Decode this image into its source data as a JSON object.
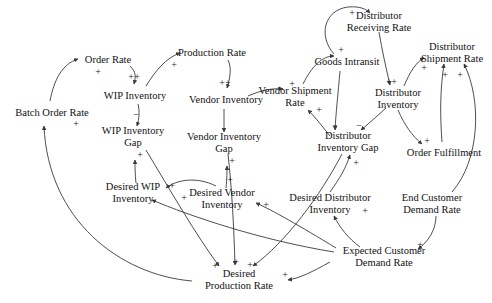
{
  "diagram": {
    "width": 492,
    "height": 303,
    "background_color": "#ffffff",
    "stroke_color": "#3a3a3a",
    "text_color": "#111111"
  },
  "nodes": [
    {
      "id": "batch_order_rate",
      "label": "Batch Order Rate",
      "lines": [
        "Batch Order Rate"
      ],
      "x": 52,
      "y": 113
    },
    {
      "id": "order_rate",
      "label": "Order Rate",
      "lines": [
        "Order Rate"
      ],
      "x": 108,
      "y": 60
    },
    {
      "id": "wip_inventory",
      "label": "WIP Inventory",
      "lines": [
        "WIP Inventory"
      ],
      "x": 135,
      "y": 96
    },
    {
      "id": "wip_inventory_gap",
      "label": "WIP Inventory Gap",
      "lines": [
        "WIP Inventory",
        "Gap"
      ],
      "x": 133,
      "y": 136
    },
    {
      "id": "production_rate",
      "label": "Production Rate",
      "lines": [
        "Production Rate"
      ],
      "x": 212,
      "y": 53
    },
    {
      "id": "vendor_inventory",
      "label": "Vendor Inventory",
      "lines": [
        "Vendor Inventory"
      ],
      "x": 226,
      "y": 100
    },
    {
      "id": "vendor_inventory_gap",
      "label": "Vendor Inventory Gap",
      "lines": [
        "Vendor Inventory",
        "Gap"
      ],
      "x": 224,
      "y": 142
    },
    {
      "id": "vendor_shipment_rate",
      "label": "Vendor Shipment Rate",
      "lines": [
        "Vendor Shipment",
        "Rate"
      ],
      "x": 295,
      "y": 96
    },
    {
      "id": "goods_intransit",
      "label": "Goods Intransit",
      "lines": [
        "Goods Intransit"
      ],
      "x": 347,
      "y": 62
    },
    {
      "id": "distributor_receiving_rate",
      "label": "Distributor Receiving Rate",
      "lines": [
        "Distributor",
        "Receiving Rate"
      ],
      "x": 379,
      "y": 21
    },
    {
      "id": "distributor_inventory",
      "label": "Distributor Inventory",
      "lines": [
        "Distributor",
        "Inventory"
      ],
      "x": 398,
      "y": 98
    },
    {
      "id": "distributor_shipment_rate",
      "label": "Distributor Shipment Rate",
      "lines": [
        "Distributor",
        "Shipment Rate"
      ],
      "x": 452,
      "y": 52
    },
    {
      "id": "distributor_inventory_gap",
      "label": "Distributor Inventory Gap",
      "lines": [
        "Distributor",
        "Inventory Gap"
      ],
      "x": 348,
      "y": 141
    },
    {
      "id": "order_fulfillment",
      "label": "Order Fulfillment",
      "lines": [
        "Order Fulfillment"
      ],
      "x": 444,
      "y": 153
    },
    {
      "id": "desired_wip_inventory",
      "label": "Desired WIP Inventory",
      "lines": [
        "Desired WIP",
        "Inventory"
      ],
      "x": 133,
      "y": 192
    },
    {
      "id": "desired_vendor_inventory",
      "label": "Desired Vendor Inventory",
      "lines": [
        "Desired Vendor",
        "Inventory"
      ],
      "x": 222,
      "y": 198
    },
    {
      "id": "desired_distributor_inventory",
      "label": "Desired Distributor Inventory",
      "lines": [
        "Desired Distributor",
        "Inventory"
      ],
      "x": 330,
      "y": 203
    },
    {
      "id": "end_customer_demand_rate",
      "label": "End Customer Demand Rate",
      "lines": [
        "End Customer",
        "Demand Rate"
      ],
      "x": 432,
      "y": 203
    },
    {
      "id": "expected_customer_demand_rate",
      "label": "Expected Customer Demand Rate",
      "lines": [
        "Expected Customer",
        "Demand Rate"
      ],
      "x": 384,
      "y": 256
    },
    {
      "id": "desired_production_rate",
      "label": "Desired Production Rate",
      "lines": [
        "Desired",
        "Production Rate"
      ],
      "x": 239,
      "y": 279
    }
  ],
  "signs": [
    {
      "id": "s1",
      "symbol": "+",
      "x": 76,
      "y": 124,
      "for": "batch-order-rate-inflow"
    },
    {
      "id": "s2",
      "symbol": "+",
      "x": 98,
      "y": 72,
      "for": "order-rate-inflow"
    },
    {
      "id": "s3",
      "symbol": "+",
      "x": 131,
      "y": 77,
      "for": "wip-inventory-inflow-a"
    },
    {
      "id": "s4",
      "symbol": "+",
      "x": 137,
      "y": 77,
      "for": "wip-inventory-inflow-b"
    },
    {
      "id": "s5",
      "symbol": "−",
      "x": 136,
      "y": 115,
      "for": "wip-gap-inflow"
    },
    {
      "id": "s6",
      "symbol": "+",
      "x": 140,
      "y": 155,
      "for": "wip-gap-from-desired"
    },
    {
      "id": "s7",
      "symbol": "+",
      "x": 174,
      "y": 65,
      "for": "production-rate-inflow"
    },
    {
      "id": "s8",
      "symbol": "+",
      "x": 222,
      "y": 83,
      "for": "vendor-inventory-inflow-a"
    },
    {
      "id": "s9",
      "symbol": "+",
      "x": 228,
      "y": 83,
      "for": "vendor-inventory-inflow-b"
    },
    {
      "id": "s10",
      "symbol": "+",
      "x": 232,
      "y": 161,
      "for": "vendor-gap-from-desired"
    },
    {
      "id": "s11",
      "symbol": "+",
      "x": 292,
      "y": 84,
      "for": "vendor-shipment-inflow"
    },
    {
      "id": "s12",
      "symbol": "+",
      "x": 319,
      "y": 110,
      "for": "vendor-shipment-from-gap"
    },
    {
      "id": "s13",
      "symbol": "+",
      "x": 341,
      "y": 50,
      "for": "goods-intransit-inflow"
    },
    {
      "id": "s14",
      "symbol": "+",
      "x": 352,
      "y": 13,
      "for": "distributor-receiving-inflow"
    },
    {
      "id": "s15",
      "symbol": "+",
      "x": 389,
      "y": 82,
      "for": "distributor-inventory-inflow-a"
    },
    {
      "id": "s16",
      "symbol": "+",
      "x": 394,
      "y": 82,
      "for": "distributor-inventory-inflow-b"
    },
    {
      "id": "s17",
      "symbol": "−",
      "x": 335,
      "y": 126,
      "for": "dist-gap-from-intransit"
    },
    {
      "id": "s18",
      "symbol": "−",
      "x": 359,
      "y": 126,
      "for": "dist-gap-from-inventory"
    },
    {
      "id": "s19",
      "symbol": "+",
      "x": 356,
      "y": 163,
      "for": "dist-gap-from-desired"
    },
    {
      "id": "s20",
      "symbol": "+",
      "x": 424,
      "y": 68,
      "for": "distributor-shipment-inflow-a"
    },
    {
      "id": "s21",
      "symbol": "+",
      "x": 445,
      "y": 75,
      "for": "distributor-shipment-inflow-b"
    },
    {
      "id": "s22",
      "symbol": "+",
      "x": 460,
      "y": 75,
      "for": "distributor-shipment-inflow-c"
    },
    {
      "id": "s23",
      "symbol": "+",
      "x": 427,
      "y": 141,
      "for": "order-fulfillment-inflow"
    },
    {
      "id": "s24",
      "symbol": "+",
      "x": 172,
      "y": 186,
      "for": "desired-wip-sign"
    },
    {
      "id": "s25",
      "symbol": "+",
      "x": 184,
      "y": 198,
      "for": "desired-wip-inflow"
    },
    {
      "id": "s26",
      "symbol": "+",
      "x": 230,
      "y": 180,
      "for": "desired-vendor-up"
    },
    {
      "id": "s27",
      "symbol": "+",
      "x": 266,
      "y": 205,
      "for": "desired-vendor-inflow"
    },
    {
      "id": "s28",
      "symbol": "+",
      "x": 365,
      "y": 211,
      "for": "desired-distributor-inflow"
    },
    {
      "id": "s29",
      "symbol": "+",
      "x": 420,
      "y": 245,
      "for": "expected-demand-inflow"
    },
    {
      "id": "s30",
      "symbol": "+",
      "x": 215,
      "y": 266,
      "for": "desired-production-inflow-a"
    },
    {
      "id": "s31",
      "symbol": "+",
      "x": 236,
      "y": 262,
      "for": "desired-production-inflow-b"
    },
    {
      "id": "s32",
      "symbol": "+",
      "x": 250,
      "y": 265,
      "for": "desired-production-inflow-c"
    },
    {
      "id": "s33",
      "symbol": "+",
      "x": 285,
      "y": 275,
      "for": "desired-production-from-expected"
    }
  ],
  "edges": [
    {
      "id": "e1",
      "from": "desired_production_rate",
      "to": "batch_order_rate",
      "polarity": "+"
    },
    {
      "id": "e2",
      "from": "batch_order_rate",
      "to": "order_rate",
      "polarity": "+"
    },
    {
      "id": "e3",
      "from": "order_rate",
      "to": "wip_inventory",
      "polarity": "+"
    },
    {
      "id": "e4",
      "from": "wip_inventory",
      "to": "production_rate",
      "polarity": "+"
    },
    {
      "id": "e5",
      "from": "wip_inventory",
      "to": "wip_inventory_gap",
      "polarity": "−"
    },
    {
      "id": "e6",
      "from": "desired_wip_inventory",
      "to": "wip_inventory_gap",
      "polarity": "+"
    },
    {
      "id": "e7",
      "from": "wip_inventory_gap",
      "to": "desired_production_rate",
      "polarity": "+"
    },
    {
      "id": "e8",
      "from": "production_rate",
      "to": "vendor_inventory",
      "polarity": "+"
    },
    {
      "id": "e9",
      "from": "vendor_inventory",
      "to": "vendor_shipment_rate",
      "polarity": "+"
    },
    {
      "id": "e10",
      "from": "vendor_inventory",
      "to": "vendor_inventory_gap",
      "polarity": "−"
    },
    {
      "id": "e11",
      "from": "desired_vendor_inventory",
      "to": "vendor_inventory_gap",
      "polarity": "+"
    },
    {
      "id": "e12",
      "from": "vendor_inventory_gap",
      "to": "desired_production_rate",
      "polarity": "+"
    },
    {
      "id": "e13",
      "from": "distributor_inventory_gap",
      "to": "vendor_shipment_rate",
      "polarity": "+"
    },
    {
      "id": "e14",
      "from": "vendor_shipment_rate",
      "to": "goods_intransit",
      "polarity": "+"
    },
    {
      "id": "e15",
      "from": "goods_intransit",
      "to": "distributor_receiving_rate",
      "polarity": "+"
    },
    {
      "id": "e16",
      "from": "goods_intransit",
      "to": "distributor_inventory_gap",
      "polarity": "−"
    },
    {
      "id": "e17",
      "from": "distributor_receiving_rate",
      "to": "distributor_inventory",
      "polarity": "+"
    },
    {
      "id": "e18",
      "from": "distributor_inventory",
      "to": "distributor_shipment_rate",
      "polarity": "+"
    },
    {
      "id": "e19",
      "from": "distributor_inventory",
      "to": "distributor_inventory_gap",
      "polarity": "−"
    },
    {
      "id": "e20",
      "from": "distributor_inventory",
      "to": "order_fulfillment",
      "polarity": "+"
    },
    {
      "id": "e21",
      "from": "desired_distributor_inventory",
      "to": "distributor_inventory_gap",
      "polarity": "+"
    },
    {
      "id": "e22",
      "from": "expected_customer_demand_rate",
      "to": "desired_distributor_inventory",
      "polarity": "+"
    },
    {
      "id": "e23",
      "from": "end_customer_demand_rate",
      "to": "expected_customer_demand_rate",
      "polarity": "+"
    },
    {
      "id": "e24",
      "from": "end_customer_demand_rate",
      "to": "distributor_shipment_rate",
      "polarity": "+"
    },
    {
      "id": "e25",
      "from": "order_fulfillment",
      "to": "distributor_shipment_rate",
      "polarity": "+"
    },
    {
      "id": "e26",
      "from": "expected_customer_demand_rate",
      "to": "desired_wip_inventory",
      "polarity": "+"
    },
    {
      "id": "e27",
      "from": "expected_customer_demand_rate",
      "to": "desired_vendor_inventory",
      "polarity": "+"
    },
    {
      "id": "e28",
      "from": "expected_customer_demand_rate",
      "to": "desired_production_rate",
      "polarity": "+"
    },
    {
      "id": "e29",
      "from": "distributor_inventory_gap",
      "to": "desired_production_rate",
      "polarity": "+"
    }
  ]
}
